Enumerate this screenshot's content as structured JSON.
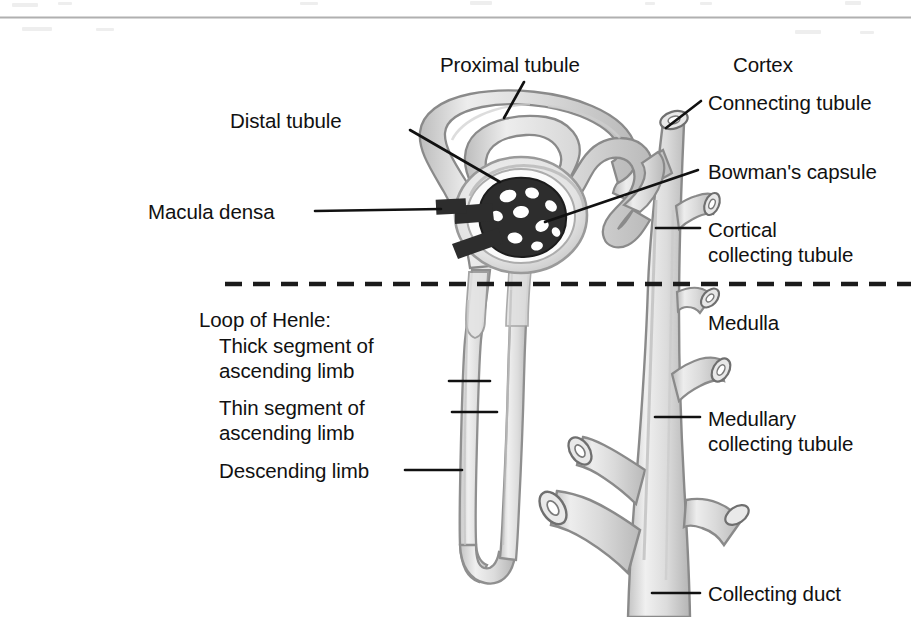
{
  "figure": {
    "top_rule": true,
    "colors": {
      "ink": "#111111",
      "tubule_fill": "#d7d7d7",
      "tubule_fill_light": "#e6e6e6",
      "tubule_outline": "#8c8c8c",
      "tubule_outline_dark": "#6f6f6f",
      "glomerulus_dark": "#2b2b2b",
      "lumen_white": "#ffffff",
      "background": "#ffffff",
      "rule_gray": "#b5b5b5"
    },
    "divider": {
      "name": "cortex-medulla-boundary",
      "style": "dashed",
      "y": 284,
      "x_start": 225,
      "x_end": 911
    }
  },
  "labels": {
    "proximal_tubule": "Proximal tubule",
    "distal_tubule": "Distal tubule",
    "macula_densa": "Macula densa",
    "cortex": "Cortex",
    "connecting_tubule": "Connecting tubule",
    "bowmans_capsule": "Bowman's capsule",
    "cortical_collecting_tubule_l1": "Cortical",
    "cortical_collecting_tubule_l2": "collecting tubule",
    "loop_of_henle_heading": "Loop of Henle:",
    "thick_segment_l1": "Thick segment of",
    "thick_segment_l2": "ascending limb",
    "thin_segment_l1": "Thin segment of",
    "thin_segment_l2": "ascending limb",
    "descending_limb": "Descending limb",
    "medulla": "Medulla",
    "medullary_collecting_tubule_l1": "Medullary",
    "medullary_collecting_tubule_l2": "collecting tubule",
    "collecting_duct": "Collecting duct"
  },
  "regions": [
    {
      "name": "cortex",
      "label": "Cortex"
    },
    {
      "name": "medulla",
      "label": "Medulla"
    }
  ],
  "structures": [
    {
      "name": "proximal-tubule",
      "label": "Proximal tubule"
    },
    {
      "name": "distal-tubule",
      "label": "Distal tubule"
    },
    {
      "name": "macula-densa",
      "label": "Macula densa"
    },
    {
      "name": "connecting-tubule",
      "label": "Connecting tubule"
    },
    {
      "name": "bowmans-capsule",
      "label": "Bowman's capsule"
    },
    {
      "name": "cortical-collecting-tubule",
      "label": "Cortical collecting tubule"
    },
    {
      "name": "thick-ascending-limb",
      "label": "Thick segment of ascending limb"
    },
    {
      "name": "thin-ascending-limb",
      "label": "Thin segment of ascending limb"
    },
    {
      "name": "descending-limb",
      "label": "Descending limb"
    },
    {
      "name": "medullary-collecting-tubule",
      "label": "Medullary collecting tubule"
    },
    {
      "name": "collecting-duct",
      "label": "Collecting duct"
    }
  ]
}
